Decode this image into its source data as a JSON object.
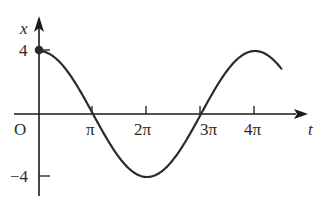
{
  "chart_data": {
    "type": "line",
    "title": "",
    "xlabel": "t",
    "ylabel": "x",
    "origin_label": "O",
    "x_ticks": [
      {
        "value": 3.14159,
        "label": "π"
      },
      {
        "value": 6.28319,
        "label": "2π"
      },
      {
        "value": 9.42478,
        "label": "3π"
      },
      {
        "value": 12.56637,
        "label": "4π"
      }
    ],
    "y_ticks": [
      {
        "value": 4,
        "label": "4"
      },
      {
        "value": -4,
        "label": "-4"
      }
    ],
    "function": "x = 4cos(t/2)",
    "xlim": [
      0,
      14.1
    ],
    "ylim": [
      -4,
      4
    ],
    "grid": false,
    "legend": "none",
    "start_point": {
      "t": 0,
      "x": 4,
      "marked": true
    },
    "series": [
      {
        "name": "x(t)",
        "t": [
          0,
          1.5708,
          3.1416,
          4.7124,
          6.2832,
          7.854,
          9.4248,
          10.9956,
          12.5664,
          14.1
        ],
        "values": [
          4,
          2.83,
          0,
          -2.83,
          -4,
          -2.83,
          0,
          2.83,
          4,
          2.83
        ]
      }
    ]
  },
  "labels": {
    "y_axis": "x",
    "x_axis": "t",
    "origin": "O",
    "y4": "4",
    "yneg4": "−4",
    "pi": "π",
    "two_pi": "2π",
    "three_pi": "3π",
    "four_pi": "4π"
  },
  "colors": {
    "curve": "#2b2b2b",
    "axis": "#1a1a1a"
  }
}
